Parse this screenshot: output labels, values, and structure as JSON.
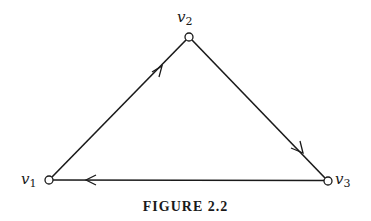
{
  "figure": {
    "caption": "FIGURE 2.2"
  },
  "graph": {
    "type": "directed",
    "vertices": [
      {
        "id": "v1",
        "name": "v",
        "sub": "1",
        "x": 49,
        "y": 180
      },
      {
        "id": "v2",
        "name": "v",
        "sub": "2",
        "x": 189,
        "y": 37
      },
      {
        "id": "v3",
        "name": "v",
        "sub": "3",
        "x": 328,
        "y": 181
      }
    ],
    "edges": [
      {
        "from": "v1",
        "to": "v2"
      },
      {
        "from": "v2",
        "to": "v3"
      },
      {
        "from": "v3",
        "to": "v1"
      }
    ]
  },
  "colors": {
    "stroke": "#1a1a1a",
    "background": "#ffffff"
  }
}
